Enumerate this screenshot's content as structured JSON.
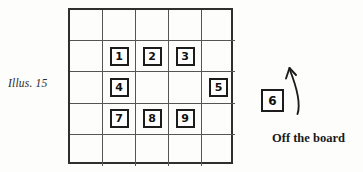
{
  "figure": {
    "caption": "Illus. 15",
    "offboard_label": "Off the board"
  },
  "board": {
    "rows": 5,
    "cols": 5,
    "line_color": "#555555",
    "border_color": "#2f2f2f",
    "background": "#fdfdfb",
    "cells": [
      [
        null,
        null,
        null,
        null,
        null
      ],
      [
        null,
        "1",
        "2",
        "3",
        null
      ],
      [
        null,
        "4",
        null,
        null,
        "5"
      ],
      [
        null,
        "7",
        "8",
        "9",
        null
      ],
      [
        null,
        null,
        null,
        null,
        null
      ]
    ]
  },
  "offboard": {
    "tile": "6",
    "arrow": "curved-up-arrow"
  }
}
